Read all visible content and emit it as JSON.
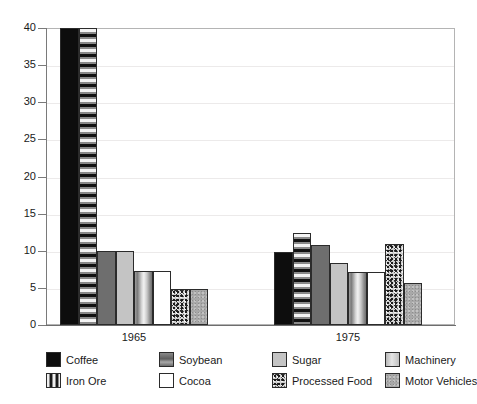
{
  "chart_data": {
    "type": "bar",
    "title": "",
    "xlabel": "",
    "ylabel": "",
    "categories": [
      "1965",
      "1975"
    ],
    "ylim": [
      0,
      40
    ],
    "ytick_labels": [
      "0",
      "5",
      "10",
      "15",
      "20",
      "25",
      "30",
      "35",
      "40"
    ],
    "ytick_values": [
      0,
      5,
      10,
      15,
      20,
      25,
      30,
      35,
      40
    ],
    "grid": true,
    "legend_position": "bottom",
    "note": "In 1965 the Coffee and Iron Ore bars are clipped at the top of the 0-40 axis.",
    "series": [
      {
        "name": "Coffee",
        "values": [
          40.0,
          9.9
        ],
        "pattern": "solid-black",
        "color": "#0d0d0d"
      },
      {
        "name": "Iron Ore",
        "values": [
          40.0,
          12.4
        ],
        "pattern": "horizontal-stripes",
        "color": "#8a8a8a"
      },
      {
        "name": "Soybean",
        "values": [
          10.0,
          10.8
        ],
        "pattern": "solid-dark-gray",
        "color": "#6e6e6e"
      },
      {
        "name": "Sugar",
        "values": [
          10.0,
          8.4
        ],
        "pattern": "solid-light-gray",
        "color": "#c4c4c4"
      },
      {
        "name": "Machinery",
        "values": [
          7.3,
          7.2
        ],
        "pattern": "gradient-cylinder",
        "color": "#c9c9c9"
      },
      {
        "name": "Cocoa",
        "values": [
          7.3,
          7.2
        ],
        "pattern": "white",
        "color": "#ffffff"
      },
      {
        "name": "Processed Food",
        "values": [
          4.8,
          10.9
        ],
        "pattern": "speckled-dark",
        "color": "#cfcfcf"
      },
      {
        "name": "Motor Vehicles",
        "values": [
          4.8,
          5.6
        ],
        "pattern": "speckled-gray",
        "color": "#a8a8a8"
      }
    ]
  },
  "legend": {
    "rows": [
      [
        {
          "label": "Coffee",
          "key": "coffee"
        },
        {
          "label": "Soybean",
          "key": "soybean"
        },
        {
          "label": "Sugar",
          "key": "sugar"
        },
        {
          "label": "Machinery",
          "key": "machinery"
        }
      ],
      [
        {
          "label": "Iron Ore",
          "key": "ironore"
        },
        {
          "label": "Cocoa",
          "key": "cocoa"
        },
        {
          "label": "Processed Food",
          "key": "processedfood"
        },
        {
          "label": "Motor Vehicles",
          "key": "motorvehicles"
        }
      ]
    ]
  },
  "colors": {
    "axis": "#6e6e6e",
    "grid": "#eceaea",
    "frame": "#b4b4b4",
    "text": "#1a1a1a",
    "background": "#ffffff"
  }
}
